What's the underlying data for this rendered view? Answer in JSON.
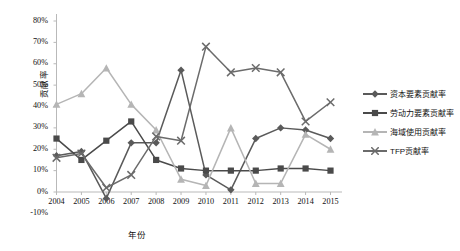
{
  "chart_data": {
    "type": "line",
    "title": "",
    "xlabel": "年份",
    "ylabel": "贡献率",
    "categories": [
      "2004",
      "2005",
      "2006",
      "2007",
      "2008",
      "2009",
      "2010",
      "2011",
      "2012",
      "2013",
      "2014",
      "2015"
    ],
    "ylim": [
      -10,
      80
    ],
    "ytick_labels": [
      "80%",
      "70%",
      "60%",
      "50%",
      "40%",
      "30%",
      "20%",
      "10%",
      "0%",
      "-10%"
    ],
    "ytick_values": [
      80,
      70,
      60,
      50,
      40,
      30,
      20,
      10,
      0,
      -10
    ],
    "grid": false,
    "legend_position": "right",
    "series": [
      {
        "name": "资本要素贡献率",
        "marker": "diamond",
        "color": "#5a5a5a",
        "values": [
          17,
          19,
          -3,
          23,
          23,
          57,
          8,
          1,
          25,
          30,
          29,
          25
        ]
      },
      {
        "name": "劳动力要素贡献率",
        "marker": "square",
        "color": "#4a4a4a",
        "values": [
          25,
          15,
          24,
          33,
          15,
          11,
          10,
          10,
          10,
          11,
          11,
          10
        ]
      },
      {
        "name": "海域使用贡献率",
        "marker": "triangle",
        "color": "#b5b5b5",
        "values": [
          41,
          46,
          58,
          41,
          29,
          6,
          3,
          30,
          4,
          4,
          27,
          20
        ]
      },
      {
        "name": "TFP贡献率",
        "marker": "cross",
        "color": "#6b6b6b",
        "values": [
          16,
          18,
          2,
          8,
          26,
          24,
          68,
          56,
          58,
          56,
          33,
          42
        ]
      }
    ]
  },
  "legend": {
    "items": [
      {
        "label": "资本要素贡献率"
      },
      {
        "label": "劳动力要素贡献率"
      },
      {
        "label": "海域使用贡献率"
      },
      {
        "label": "TFP贡献率"
      }
    ]
  }
}
